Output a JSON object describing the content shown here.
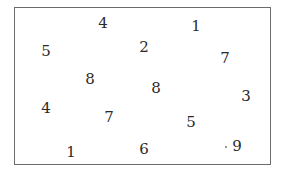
{
  "numbers": [
    {
      "value": "4",
      "x": 103,
      "y": 23
    },
    {
      "value": "1",
      "x": 196,
      "y": 26
    },
    {
      "value": "5",
      "x": 46,
      "y": 51
    },
    {
      "value": "2",
      "x": 144,
      "y": 47
    },
    {
      "value": "7",
      "x": 225,
      "y": 58
    },
    {
      "value": "8",
      "x": 90,
      "y": 79
    },
    {
      "value": "8",
      "x": 156,
      "y": 88
    },
    {
      "value": "3",
      "x": 246,
      "y": 96
    },
    {
      "value": "4",
      "x": 46,
      "y": 108
    },
    {
      "value": "7",
      "x": 109,
      "y": 117
    },
    {
      "value": "5",
      "x": 191,
      "y": 122
    },
    {
      "value": "1",
      "x": 71,
      "y": 152
    },
    {
      "value": "6",
      "x": 144,
      "y": 149
    },
    {
      "value": "9",
      "x": 237,
      "y": 146
    }
  ],
  "dots": [
    {
      "x": 225,
      "y": 146
    }
  ],
  "colors": {
    "border": "#6b6b6b",
    "text": "#2a2a2a"
  }
}
